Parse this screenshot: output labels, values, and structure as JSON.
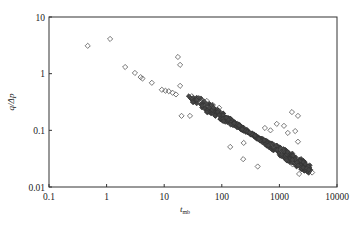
{
  "chart_data": {
    "type": "scatter",
    "title": "",
    "xlabel": "t_mb",
    "ylabel": "q/Δp",
    "xscale": "log",
    "yscale": "log",
    "xlim": [
      0.1,
      10000
    ],
    "ylim": [
      0.01,
      10
    ],
    "x_ticks": [
      "0.1",
      "1",
      "10",
      "100",
      "1000",
      "10000"
    ],
    "y_ticks": [
      "0.01",
      "0.1",
      "1",
      "10"
    ],
    "grid": false,
    "legend": null,
    "marker": "open-diamond",
    "series": [
      {
        "name": "scattered points",
        "points": [
          [
            0.47,
            3.1
          ],
          [
            1.15,
            4.1
          ],
          [
            2.1,
            1.31
          ],
          [
            3.1,
            1.03
          ],
          [
            3.9,
            0.87
          ],
          [
            4.2,
            0.82
          ],
          [
            6.1,
            0.69
          ],
          [
            9.1,
            0.52
          ],
          [
            10.5,
            0.5
          ],
          [
            12,
            0.49
          ],
          [
            14,
            0.46
          ],
          [
            17.3,
            1.97
          ],
          [
            18.9,
            1.43
          ],
          [
            18.9,
            0.61
          ],
          [
            16,
            0.43
          ],
          [
            20,
            0.18
          ],
          [
            28,
            0.18
          ],
          [
            30,
            0.4
          ],
          [
            40,
            0.36
          ],
          [
            55,
            0.33
          ],
          [
            70,
            0.28
          ],
          [
            90,
            0.25
          ],
          [
            140,
            0.051
          ],
          [
            240,
            0.06
          ],
          [
            235,
            0.031
          ],
          [
            420,
            0.023
          ],
          [
            560,
            0.11
          ],
          [
            700,
            0.1
          ],
          [
            900,
            0.13
          ],
          [
            1200,
            0.12
          ],
          [
            1650,
            0.21
          ],
          [
            1880,
            0.097
          ],
          [
            2100,
            0.18
          ],
          [
            2100,
            0.063
          ],
          [
            1700,
            0.025
          ],
          [
            2200,
            0.017
          ],
          [
            3700,
            0.018
          ],
          [
            1400,
            0.09
          ],
          [
            1100,
            0.045
          ],
          [
            800,
            0.055
          ]
        ]
      },
      {
        "name": "dense band",
        "trend": {
          "x_start": 25,
          "y_start": 0.42,
          "x_end": 3500,
          "y_end": 0.02,
          "count": 420,
          "spread_decades": 0.06
        }
      }
    ]
  }
}
